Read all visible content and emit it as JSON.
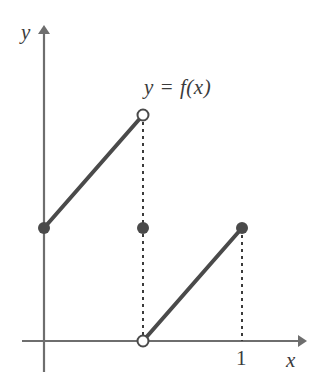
{
  "figure": {
    "title": "",
    "background_color": "#ffffff",
    "stroke_color": "#4a4a4a",
    "axis_color": "#6e6e6e",
    "labels": {
      "y_axis": "y",
      "x_axis": "x",
      "function": "y = f(x)",
      "tick_one": "1"
    }
  },
  "chart_data": {
    "type": "line",
    "title": "y = f(x)",
    "xlabel": "x",
    "ylabel": "y",
    "xlim": [
      0,
      1.25
    ],
    "ylim": [
      0,
      1.25
    ],
    "grid": false,
    "legend": null,
    "annotations": [
      {
        "text": "y = f(x)",
        "x": 0.5,
        "y": 1.12
      },
      {
        "text": "1",
        "x": 1.0,
        "y": -0.08
      }
    ],
    "xticks": [
      1
    ],
    "xticklabels": [
      "1"
    ],
    "yticks": [],
    "yticklabels": [],
    "series": [
      {
        "name": "branch-left",
        "type": "segment",
        "x": [
          0,
          0.5
        ],
        "y": [
          0.5,
          1.0
        ],
        "endpoint_start": "closed",
        "endpoint_end": "open"
      },
      {
        "name": "branch-right",
        "type": "segment",
        "x": [
          0.5,
          1.0
        ],
        "y": [
          0.0,
          0.5
        ],
        "endpoint_start": "open",
        "endpoint_end": "closed"
      }
    ],
    "points": [
      {
        "name": "left-closed-endpoint",
        "x": 0.0,
        "y": 0.5,
        "style": "filled"
      },
      {
        "name": "upper-open-endpoint",
        "x": 0.5,
        "y": 1.0,
        "style": "open"
      },
      {
        "name": "value-at-half",
        "x": 0.5,
        "y": 0.5,
        "style": "filled"
      },
      {
        "name": "lower-open-endpoint",
        "x": 0.5,
        "y": 0.0,
        "style": "open"
      },
      {
        "name": "right-closed-endpoint",
        "x": 1.0,
        "y": 0.5,
        "style": "filled"
      }
    ],
    "guides": [
      {
        "name": "guide-at-half",
        "type": "dashed-vertical",
        "x": 0.5,
        "y_from": 0.0,
        "y_to": 1.0
      },
      {
        "name": "guide-at-one",
        "type": "dashed-vertical",
        "x": 1.0,
        "y_from": 0.0,
        "y_to": 0.5
      }
    ]
  }
}
